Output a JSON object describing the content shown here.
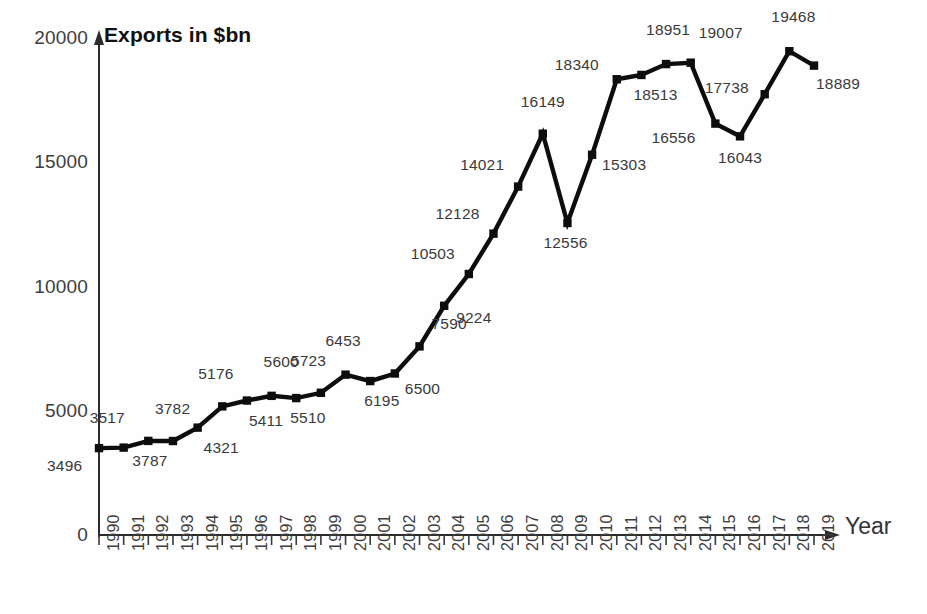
{
  "chart_data": {
    "type": "line",
    "title": "Exports in $bn",
    "xlabel": "Year",
    "ylabel": "Exports in $bn",
    "xlim": [
      1990,
      2019
    ],
    "ylim": [
      0,
      20000
    ],
    "yticks": [
      "0",
      "5000",
      "10000",
      "15000",
      "20000"
    ],
    "grid": false,
    "legend": "none",
    "marker": "square",
    "line_color": "#0d0d0d",
    "categories": [
      "1990",
      "1991",
      "1992",
      "1993",
      "1994",
      "1995",
      "1996",
      "1997",
      "1998",
      "1999",
      "2000",
      "2001",
      "2002",
      "2003",
      "2004",
      "2005",
      "2006",
      "2007",
      "2008",
      "2009",
      "2010",
      "2011",
      "2012",
      "2013",
      "2014",
      "2015",
      "2016",
      "2017",
      "2018",
      "2019"
    ],
    "values": [
      3496,
      3517,
      3787,
      3782,
      4321,
      5176,
      5411,
      5600,
      5510,
      5723,
      6453,
      6195,
      6500,
      7590,
      9224,
      10503,
      12128,
      14021,
      16149,
      12556,
      15303,
      18340,
      18513,
      18951,
      19007,
      16556,
      16043,
      17738,
      19468,
      18889
    ],
    "point_labels": [
      "3496",
      "3517",
      "3787",
      "3782",
      "4321",
      "5176",
      "5411",
      "5600",
      "5510",
      "5723",
      "6453",
      "6195",
      "6500",
      "7590",
      "9224",
      "10503",
      "12128",
      "14021",
      "16149",
      "12556",
      "15303",
      "18340",
      "18513",
      "18951",
      "19007",
      "16556",
      "16043",
      "17738",
      "19468",
      "18889"
    ]
  },
  "axes": {
    "y_tick_labels": [
      "20000",
      "15000",
      "10000",
      "5000",
      "0"
    ],
    "x_axis_title": "Year",
    "title": "Exports in $bn"
  }
}
